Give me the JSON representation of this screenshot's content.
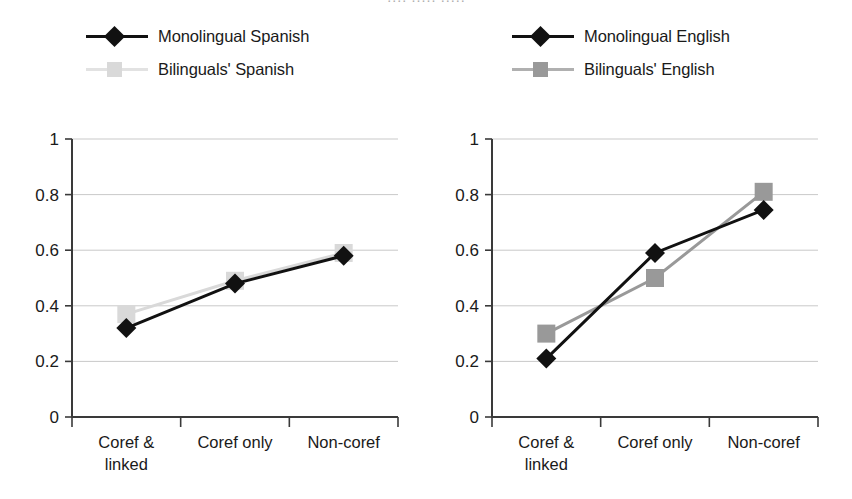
{
  "figure": {
    "background": "#ffffff",
    "top_clipped_caption": "····  ·····  ·····",
    "panels": [
      {
        "id": "spanish",
        "legend": [
          {
            "label": "Monolingual Spanish",
            "marker": "diamond",
            "color": "#111111",
            "line_color": "#111111"
          },
          {
            "label": "Bilinguals' Spanish",
            "marker": "square",
            "color": "#d9d9d9",
            "line_color": "#e2e2e2"
          }
        ]
      },
      {
        "id": "english",
        "legend": [
          {
            "label": "Monolingual English",
            "marker": "diamond",
            "color": "#111111",
            "line_color": "#111111"
          },
          {
            "label": "Bilinguals' English",
            "marker": "square",
            "color": "#999999",
            "line_color": "#b0b0b0"
          }
        ]
      }
    ]
  },
  "chart_data": [
    {
      "type": "line",
      "id": "spanish-chart",
      "title": "",
      "xlabel": "",
      "ylabel": "",
      "categories": [
        "Coref & linked",
        "Coref only",
        "Non-coref"
      ],
      "category_lines": [
        [
          "Coref &",
          "linked"
        ],
        [
          "Coref only"
        ],
        [
          "Non-coref"
        ]
      ],
      "ylim": [
        0,
        1
      ],
      "yticks": [
        0,
        0.2,
        0.4,
        0.6,
        0.8,
        1
      ],
      "ytick_labels": [
        "0",
        "0.2",
        "0.4",
        "0.6",
        "0.8",
        "1"
      ],
      "grid": true,
      "legend_position": "above",
      "series": [
        {
          "name": "Monolingual Spanish",
          "values": [
            0.32,
            0.48,
            0.58
          ],
          "marker": "diamond",
          "color": "#111111"
        },
        {
          "name": "Bilinguals' Spanish",
          "values": [
            0.37,
            0.49,
            0.59
          ],
          "marker": "square",
          "color": "#d9d9d9"
        }
      ]
    },
    {
      "type": "line",
      "id": "english-chart",
      "title": "",
      "xlabel": "",
      "ylabel": "",
      "categories": [
        "Coref & linked",
        "Coref only",
        "Non-coref"
      ],
      "category_lines": [
        [
          "Coref &",
          "linked"
        ],
        [
          "Coref only"
        ],
        [
          "Non-coref"
        ]
      ],
      "ylim": [
        0,
        1
      ],
      "yticks": [
        0,
        0.2,
        0.4,
        0.6,
        0.8,
        1
      ],
      "ytick_labels": [
        "0",
        "0.2",
        "0.4",
        "0.6",
        "0.8",
        "1"
      ],
      "grid": true,
      "legend_position": "above",
      "series": [
        {
          "name": "Monolingual English",
          "values": [
            0.21,
            0.59,
            0.745
          ],
          "marker": "diamond",
          "color": "#111111"
        },
        {
          "name": "Bilinguals' English",
          "values": [
            0.3,
            0.5,
            0.81
          ],
          "marker": "square",
          "color": "#999999"
        }
      ]
    }
  ]
}
